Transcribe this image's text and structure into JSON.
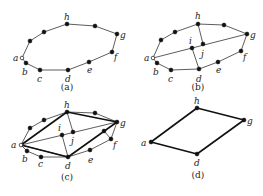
{
  "panels": [
    {
      "id": "a",
      "caption": "(a)",
      "cycle": [
        [
          22,
          58
        ],
        [
          26,
          63
        ],
        [
          40,
          70
        ],
        [
          68,
          70
        ],
        [
          89,
          62
        ],
        [
          112,
          52
        ],
        [
          117,
          34
        ],
        [
          95,
          26
        ],
        [
          67,
          24
        ],
        [
          44,
          32
        ],
        [
          30,
          41
        ]
      ],
      "labels": [
        {
          "t": "a",
          "x": 13,
          "y": 61
        },
        {
          "t": "b",
          "x": 22,
          "y": 75
        },
        {
          "t": "c",
          "x": 37,
          "y": 82
        },
        {
          "t": "d",
          "x": 65,
          "y": 82
        },
        {
          "t": "e",
          "x": 87,
          "y": 73
        },
        {
          "t": "f",
          "x": 114,
          "y": 60
        },
        {
          "t": "g",
          "x": 120,
          "y": 38
        },
        {
          "t": "h",
          "x": 64,
          "y": 20
        }
      ],
      "extra_edges": [],
      "thick_edges": [],
      "capx": 67,
      "capy": 90
    },
    {
      "id": "b",
      "caption": "(b)",
      "cycle": [
        [
          153,
          58
        ],
        [
          157,
          63
        ],
        [
          171,
          70
        ],
        [
          199,
          69
        ],
        [
          218,
          62
        ],
        [
          241,
          51
        ],
        [
          247,
          34
        ],
        [
          224,
          25
        ],
        [
          198,
          24
        ],
        [
          175,
          32
        ],
        [
          161,
          40
        ]
      ],
      "labels": [
        {
          "t": "a",
          "x": 144,
          "y": 61
        },
        {
          "t": "b",
          "x": 153,
          "y": 75
        },
        {
          "t": "c",
          "x": 168,
          "y": 82
        },
        {
          "t": "d",
          "x": 196,
          "y": 82
        },
        {
          "t": "e",
          "x": 216,
          "y": 73
        },
        {
          "t": "f",
          "x": 243,
          "y": 60
        },
        {
          "t": "g",
          "x": 250,
          "y": 38
        },
        {
          "t": "h",
          "x": 195,
          "y": 19
        },
        {
          "t": "i",
          "x": 189,
          "y": 44
        },
        {
          "t": "j",
          "x": 201,
          "y": 57
        }
      ],
      "inner": [
        [
          192,
          48
        ],
        [
          203,
          44
        ]
      ],
      "extra_edges": [
        [
          [
            153,
            58
          ],
          [
            247,
            34
          ]
        ],
        [
          [
            198,
            24
          ],
          [
            203,
            44
          ]
        ],
        [
          [
            192,
            48
          ],
          [
            199,
            69
          ]
        ]
      ],
      "thick_edges": [],
      "capx": 198,
      "capy": 90
    },
    {
      "id": "c",
      "caption": "(c)",
      "cycle": [
        [
          21,
          145
        ],
        [
          27,
          151
        ],
        [
          41,
          157
        ],
        [
          68,
          157
        ],
        [
          90,
          150
        ],
        [
          111,
          139
        ],
        [
          117,
          122
        ],
        [
          95,
          113
        ],
        [
          67,
          112
        ],
        [
          44,
          120
        ],
        [
          30,
          128
        ]
      ],
      "labels": [
        {
          "t": "a",
          "x": 11,
          "y": 148
        },
        {
          "t": "b",
          "x": 22,
          "y": 162
        },
        {
          "t": "c",
          "x": 38,
          "y": 167
        },
        {
          "t": "d",
          "x": 65,
          "y": 169
        },
        {
          "t": "e",
          "x": 88,
          "y": 163
        },
        {
          "t": "f",
          "x": 113,
          "y": 148
        },
        {
          "t": "g",
          "x": 120,
          "y": 126
        },
        {
          "t": "h",
          "x": 64,
          "y": 108
        },
        {
          "t": "i",
          "x": 58,
          "y": 131
        },
        {
          "t": "j",
          "x": 71,
          "y": 144
        }
      ],
      "inner": [
        [
          62,
          135
        ],
        [
          73,
          132
        ],
        [
          104,
          131
        ]
      ],
      "extra_edges": [
        [
          [
            21,
            145
          ],
          [
            117,
            122
          ]
        ],
        [
          [
            67,
            112
          ],
          [
            73,
            132
          ]
        ],
        [
          [
            62,
            135
          ],
          [
            68,
            157
          ]
        ],
        [
          [
            104,
            131
          ],
          [
            111,
            139
          ]
        ],
        [
          [
            21,
            145
          ],
          [
            68,
            157
          ]
        ]
      ],
      "thick_edges": [
        [
          [
            21,
            145
          ],
          [
            67,
            112
          ]
        ],
        [
          [
            67,
            112
          ],
          [
            117,
            122
          ]
        ],
        [
          [
            117,
            122
          ],
          [
            68,
            157
          ]
        ],
        [
          [
            68,
            157
          ],
          [
            21,
            145
          ]
        ]
      ],
      "capx": 67,
      "capy": 180
    },
    {
      "id": "d",
      "caption": "(d)",
      "cycle": [],
      "labels": [
        {
          "t": "a",
          "x": 141,
          "y": 146
        },
        {
          "t": "d",
          "x": 194,
          "y": 166
        },
        {
          "t": "g",
          "x": 247,
          "y": 124
        },
        {
          "t": "h",
          "x": 194,
          "y": 104
        }
      ],
      "corners": [
        [
          151,
          142
        ],
        [
          197,
          154
        ],
        [
          244,
          120
        ],
        [
          197,
          108
        ]
      ],
      "extra_edges": [],
      "thick_edges": [
        [
          [
            151,
            142
          ],
          [
            197,
            108
          ]
        ],
        [
          [
            197,
            108
          ],
          [
            244,
            120
          ]
        ],
        [
          [
            244,
            120
          ],
          [
            197,
            154
          ]
        ],
        [
          [
            197,
            154
          ],
          [
            151,
            142
          ]
        ]
      ],
      "capx": 198,
      "capy": 178
    }
  ]
}
